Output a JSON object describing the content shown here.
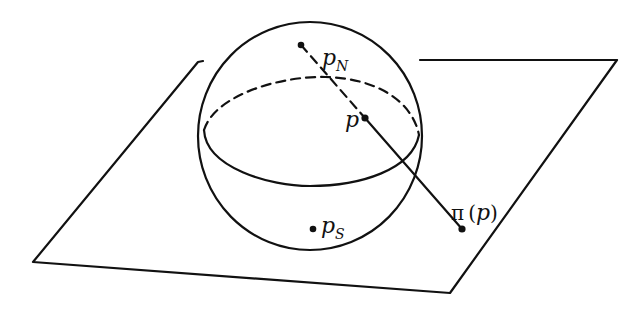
{
  "diagram": {
    "labels": {
      "north_pole": {
        "base": "p",
        "subscript": "N"
      },
      "point": {
        "base": "p"
      },
      "projection": {
        "func": "π",
        "open": "(",
        "arg": "p",
        "close": ")"
      },
      "south_pole": {
        "base": "p",
        "subscript": "S"
      }
    },
    "colors": {
      "ink": "#111111",
      "background": "#ffffff"
    }
  }
}
